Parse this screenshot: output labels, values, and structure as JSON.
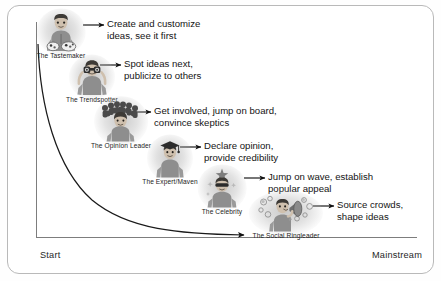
{
  "diagram": {
    "frame_color": "#b9b9b9",
    "axis_color": "#7d7d7d",
    "curve_color": "#1a1a1a",
    "axis": {
      "x_start_label": "Start",
      "x_end_label": "Mainstream",
      "y_label": ""
    },
    "personas": [
      {
        "id": "tastemaker",
        "name": "The Tastemaker",
        "icon": "person-with-palette-icon",
        "callout": [
          "Create and customize",
          "ideas, see it first"
        ]
      },
      {
        "id": "trendspotter",
        "name": "The Trendspotter",
        "icon": "person-with-binoculars-icon",
        "callout": [
          "Spot ideas next,",
          "publicize to others"
        ]
      },
      {
        "id": "opinion-leader",
        "name": "The Opinion Leader",
        "icon": "person-with-crowd-icon",
        "callout": [
          "Get involved, jump on board,",
          "convince skeptics"
        ]
      },
      {
        "id": "expert-maven",
        "name": "The Expert/Maven",
        "icon": "person-with-graduation-cap-icon",
        "callout": [
          "Declare opinion,",
          "provide credibility"
        ]
      },
      {
        "id": "celebrity",
        "name": "The Celebrity",
        "icon": "person-with-sunglasses-star-icon",
        "callout": [
          "Jump on wave, establish",
          "popular appeal"
        ]
      },
      {
        "id": "social-ringleader",
        "name": "The Social Ringleader",
        "icon": "person-with-megaphone-icon",
        "callout": [
          "Source crowds,",
          "shape ideas"
        ]
      }
    ]
  }
}
